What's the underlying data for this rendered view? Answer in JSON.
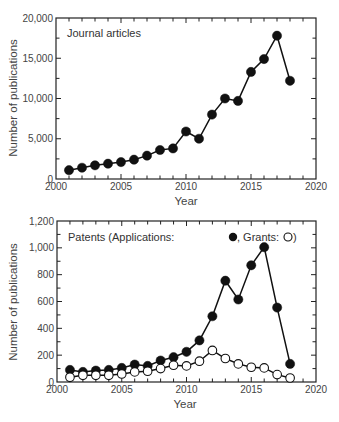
{
  "chart_data": [
    {
      "type": "line",
      "title": "Journal articles",
      "xlabel": "Year",
      "ylabel": "Number of publications",
      "xlim": [
        2000,
        2020
      ],
      "ylim": [
        0,
        20000
      ],
      "x_ticks": [
        2000,
        2005,
        2010,
        2015,
        2020
      ],
      "x_tick_labels": [
        "2000",
        "2005",
        "2010",
        "2015",
        "2020"
      ],
      "y_ticks": [
        0,
        5000,
        10000,
        15000,
        20000
      ],
      "y_tick_labels": [
        "0",
        "5,000",
        "10,000",
        "15,000",
        "20,000"
      ],
      "grid": false,
      "legend_position": "top-left",
      "x": [
        2001,
        2002,
        2003,
        2004,
        2005,
        2006,
        2007,
        2008,
        2009,
        2010,
        2011,
        2012,
        2013,
        2014,
        2015,
        2016,
        2017,
        2018
      ],
      "series": [
        {
          "name": "Journal articles",
          "marker": "filled-circle",
          "values": [
            1100,
            1400,
            1700,
            1900,
            2100,
            2400,
            2900,
            3600,
            3800,
            5900,
            5000,
            8000,
            10000,
            9700,
            13300,
            14900,
            17800,
            12200
          ]
        }
      ]
    },
    {
      "type": "line",
      "title": "Patents (Applications: ●, Grants: ○)",
      "legend_prefix": "Patents (Applications: ",
      "legend_mid": ", Grants: ",
      "legend_suffix": ")",
      "xlabel": "Year",
      "ylabel": "Number of publications",
      "xlim": [
        2000,
        2020
      ],
      "ylim": [
        0,
        1200
      ],
      "x_ticks": [
        2000,
        2005,
        2010,
        2015,
        2020
      ],
      "x_tick_labels": [
        "2000",
        "2005",
        "2010",
        "2015",
        "2020"
      ],
      "y_ticks": [
        0,
        200,
        400,
        600,
        800,
        1000,
        1200
      ],
      "y_tick_labels": [
        "0",
        "200",
        "400",
        "600",
        "800",
        "1,000",
        "1,200"
      ],
      "grid": false,
      "legend_position": "top-left",
      "x": [
        2001,
        2002,
        2003,
        2004,
        2005,
        2006,
        2007,
        2008,
        2009,
        2010,
        2011,
        2012,
        2013,
        2014,
        2015,
        2016,
        2017,
        2018
      ],
      "series": [
        {
          "name": "Applications",
          "marker": "filled-circle",
          "values": [
            90,
            75,
            85,
            90,
            105,
            130,
            120,
            160,
            185,
            225,
            310,
            490,
            755,
            615,
            870,
            1005,
            555,
            135
          ]
        },
        {
          "name": "Grants",
          "marker": "open-circle",
          "values": [
            35,
            50,
            50,
            50,
            60,
            75,
            80,
            100,
            125,
            120,
            155,
            235,
            175,
            135,
            110,
            105,
            55,
            30
          ]
        }
      ]
    }
  ]
}
